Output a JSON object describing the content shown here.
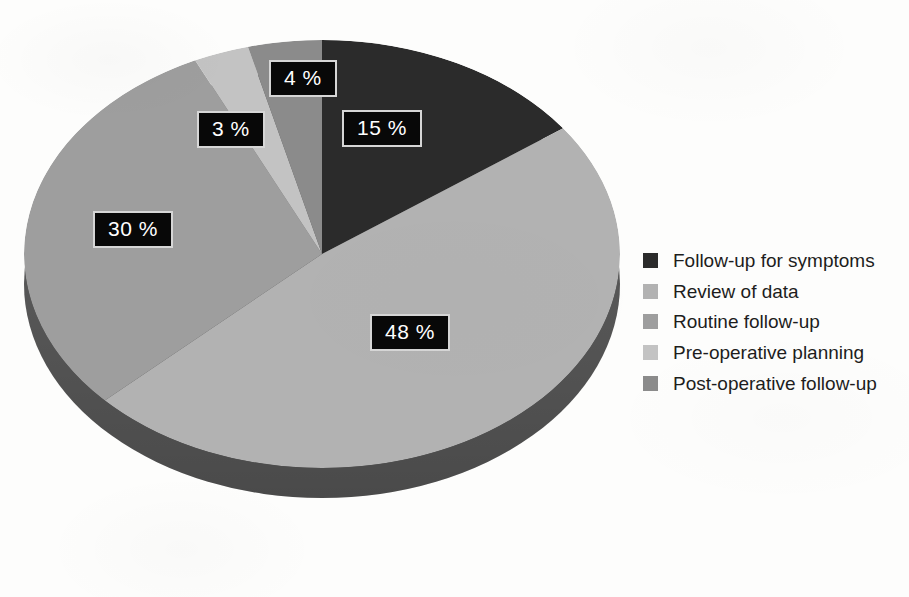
{
  "chart_data": {
    "type": "pie",
    "title": "",
    "subtitle": "",
    "xlabel": "",
    "ylabel": "",
    "legend_position": "right",
    "grid": false,
    "three_d": true,
    "value_unit": "%",
    "categories": [
      "Follow-up for symptoms",
      "Review of data",
      "Routine follow-up",
      "Pre-operative planning",
      "Post-operative follow-up"
    ],
    "values": [
      15,
      48,
      30,
      3,
      4
    ],
    "value_labels": [
      "15 %",
      "48 %",
      "30 %",
      "3 %",
      "4 %"
    ],
    "colors": [
      "#2b2b2b",
      "#b2b2b2",
      "#9e9e9e",
      "#c3c3c3",
      "#8b8b8b"
    ],
    "slices": [
      {
        "label": "Follow-up for symptoms",
        "value": 15,
        "display": "15 %",
        "color": "#2b2b2b"
      },
      {
        "label": "Review of data",
        "value": 48,
        "display": "48 %",
        "color": "#b2b2b2"
      },
      {
        "label": "Routine follow-up",
        "value": 30,
        "display": "30 %",
        "color": "#9e9e9e"
      },
      {
        "label": "Pre-operative planning",
        "value": 3,
        "display": "3 %",
        "color": "#c3c3c3"
      },
      {
        "label": "Post-operative follow-up",
        "value": 4,
        "display": "4 %",
        "color": "#8b8b8b"
      }
    ]
  },
  "pie": {
    "labels": {
      "slice_1": "15 %",
      "slice_2": "48 %",
      "slice_3": "30 %",
      "slice_4": "3 %",
      "slice_5": "4 %"
    }
  },
  "legend": {
    "items": [
      {
        "label": "Follow-up for symptoms",
        "color": "#2b2b2b"
      },
      {
        "label": "Review of data",
        "color": "#b2b2b2"
      },
      {
        "label": "Routine follow-up",
        "color": "#9e9e9e"
      },
      {
        "label": "Pre-operative planning",
        "color": "#c3c3c3"
      },
      {
        "label": "Post-operative follow-up",
        "color": "#8b8b8b"
      }
    ]
  },
  "theme": {
    "background": "#fdfdfc",
    "label_box_fill": "#080808",
    "label_box_border": "#d6d6d6",
    "label_text": "#ffffff",
    "pie_depth": "#565656",
    "legend_text": "#1d1d1d"
  }
}
